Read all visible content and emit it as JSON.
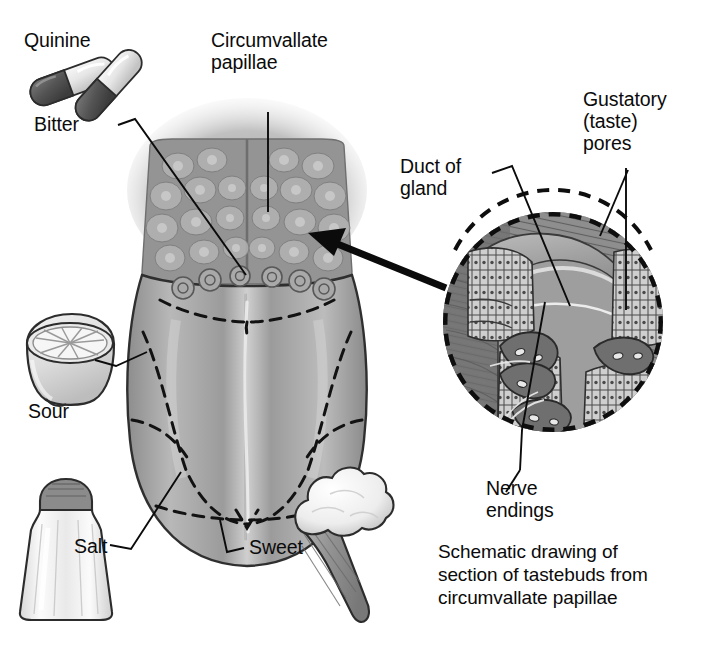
{
  "figure": {
    "title_caption": "Schematic drawing of\nsection of tastebuds from\ncircumvallate papillae",
    "accent_ink": "#0b0b0b",
    "tongue_gray": "#9a9a9a",
    "tongue_dark_gray": "#7d7d7d",
    "inset_gray": "#8e8e8e",
    "inset_dark_gray": "#6a6a6a",
    "page_bg": "#ffffff"
  },
  "labels": {
    "quinine": "Quinine",
    "bitter": "Bitter",
    "circumvallate_papillae": "Circumvallate\npapillae",
    "sour": "Sour",
    "salt": "Salt",
    "sweet": "Sweet",
    "duct_of_gland": "Duct of\ngland",
    "gustatory_taste_pores": "Gustatory\n(taste)\npores",
    "nerve_endings": "Nerve\nendings"
  },
  "taste_zones": [
    {
      "name": "bitter",
      "label": "Bitter",
      "region": "posterior tongue / circumvallate row",
      "stimulus_icon": "quinine-capsules-icon"
    },
    {
      "name": "sour",
      "label": "Sour",
      "region": "lateral posterior margins",
      "stimulus_icon": "lemon-half-icon"
    },
    {
      "name": "salt",
      "label": "Salt",
      "region": "lateral anterior margins",
      "stimulus_icon": "salt-shaker-icon"
    },
    {
      "name": "sweet",
      "label": "Sweet",
      "region": "tongue tip",
      "stimulus_icon": "ice-cream-cone-icon"
    }
  ],
  "inset": {
    "shape": "circle",
    "callouts": [
      "Duct of gland",
      "Gustatory (taste) pores",
      "Nerve endings"
    ],
    "source_arrow": "arrow-from-inset-to-tongue"
  },
  "icons": {
    "quinine": "quinine-capsules-icon",
    "lemon": "lemon-half-icon",
    "salt": "salt-shaker-icon",
    "ice_cream": "ice-cream-cone-icon",
    "magnify_arrow": "magnify-arrow-icon"
  }
}
